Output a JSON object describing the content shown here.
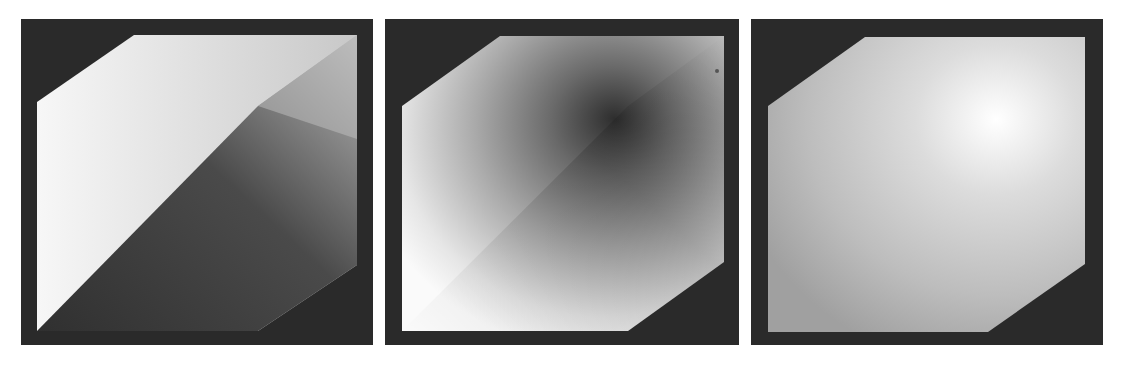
{
  "figure": {
    "background_color": "#ffffff",
    "frame_color": "#2a2a2a",
    "panels": [
      {
        "id": "panel-1",
        "shading": "flat two-tone split along diagonal",
        "light_color": "#f4f4f4",
        "dark_color": "#3a3a3a"
      },
      {
        "id": "panel-2",
        "shading": "radial dark center with bright edges",
        "center_color": "#2e2e2e",
        "edge_color": "#fafafa"
      },
      {
        "id": "panel-3",
        "shading": "smooth gradient with upper-right highlight",
        "highlight_color": "#ffffff",
        "base_color": "#a8a8a8"
      }
    ]
  },
  "caption": ""
}
